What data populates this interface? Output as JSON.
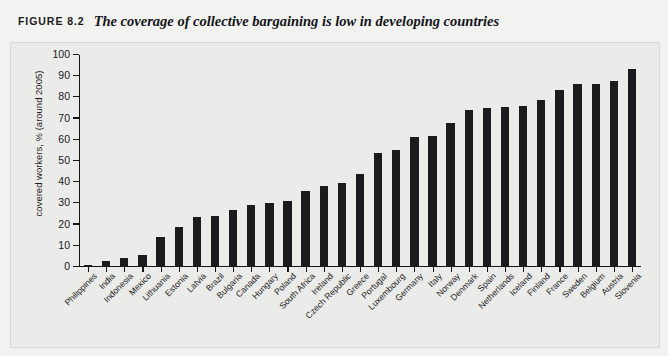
{
  "caption": {
    "label": "FIGURE 8.2",
    "title": "The coverage of collective bargaining is low in developing countries"
  },
  "colors": {
    "page_background": "#f2f2f0",
    "plot_background": "#ebebe9",
    "bar": "#1b1b1b",
    "axis": "#151515",
    "text": "#1a1a1a"
  },
  "chart_data": {
    "type": "bar",
    "title": "The coverage of collective bargaining is low in developing countries",
    "xlabel": "",
    "ylabel": "covered workers, % (around 2005)",
    "ylim": [
      0,
      100
    ],
    "yticks": [
      0,
      10,
      20,
      30,
      40,
      50,
      60,
      70,
      80,
      90,
      100
    ],
    "grid": false,
    "legend": null,
    "categories": [
      "Philippines",
      "India",
      "Indonesia",
      "Mexico",
      "Lithuania",
      "Estonia",
      "Latvia",
      "Brazil",
      "Bulgaria",
      "Canada",
      "Hungary",
      "Poland",
      "South Africa",
      "Ireland",
      "Czech Republic",
      "Greece",
      "Portugal",
      "Luxembourg",
      "Germany",
      "Italy",
      "Norway",
      "Denmark",
      "Spain",
      "Netherlands",
      "Iceland",
      "Finland",
      "France",
      "Sweden",
      "Belgium",
      "Austria",
      "Slovenia"
    ],
    "values": [
      0.5,
      2.0,
      3.7,
      5.0,
      13.5,
      18.0,
      23.0,
      23.3,
      26.2,
      28.8,
      29.5,
      30.6,
      35.2,
      37.5,
      39.2,
      43.4,
      53.0,
      54.5,
      60.7,
      61.0,
      67.4,
      73.2,
      74.3,
      74.6,
      75.2,
      78.2,
      82.8,
      85.5,
      85.9,
      87.0,
      92.7
    ]
  }
}
